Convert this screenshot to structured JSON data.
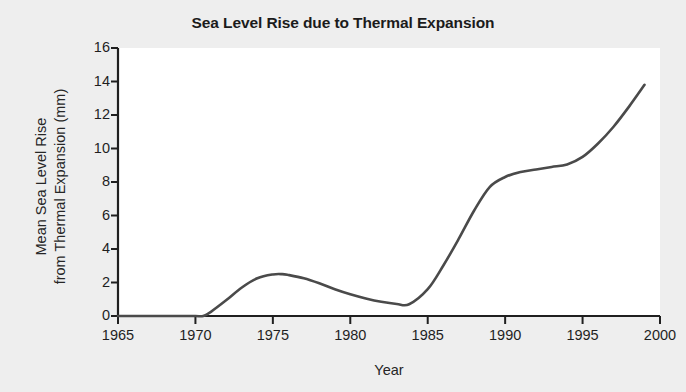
{
  "chart_data": {
    "type": "line",
    "title": "Sea Level Rise due to Thermal Expansion",
    "xlabel": "Year",
    "ylabel": "Mean Sea Level Rise\nfrom Thermal Expansion (mm)",
    "ylabel_line1": "Mean Sea Level Rise",
    "ylabel_line2": "from Thermal Expansion (mm)",
    "xlim": [
      1965,
      2000
    ],
    "ylim": [
      0,
      16
    ],
    "xticks": [
      1965,
      1970,
      1975,
      1980,
      1985,
      1990,
      1995,
      2000
    ],
    "xtick_labels": [
      "1965",
      "1970",
      "1975",
      "1980",
      "1985",
      "1990",
      "1995",
      "2000"
    ],
    "yticks": [
      0,
      2,
      4,
      6,
      8,
      10,
      12,
      14,
      16
    ],
    "ytick_labels": [
      "0",
      "2",
      "4",
      "6",
      "8",
      "10",
      "12",
      "14",
      "16"
    ],
    "grid": false,
    "legend": null,
    "line_color": "#4a4a4a",
    "line_width": 2.6,
    "plot_background": "#ffffff",
    "figure_background": "#eeeeee",
    "axis_color": "#1f1f1f",
    "series": [
      {
        "name": "Mean sea level rise from thermal expansion",
        "x": [
          1965,
          1966,
          1967,
          1968,
          1969,
          1970,
          1970.5,
          1971,
          1972,
          1973,
          1974,
          1975,
          1975.6,
          1976,
          1977,
          1978,
          1979,
          1980,
          1981,
          1982,
          1983,
          1983.8,
          1985,
          1986,
          1987,
          1988,
          1989,
          1990,
          1991,
          1992,
          1993,
          1994,
          1995,
          1996,
          1997,
          1998,
          1999
        ],
        "y": [
          0,
          0,
          0,
          0,
          0,
          0,
          0,
          0.25,
          0.95,
          1.7,
          2.25,
          2.48,
          2.5,
          2.45,
          2.25,
          1.95,
          1.6,
          1.3,
          1.05,
          0.85,
          0.72,
          0.7,
          1.6,
          3.0,
          4.6,
          6.3,
          7.7,
          8.3,
          8.6,
          8.75,
          8.9,
          9.05,
          9.5,
          10.3,
          11.3,
          12.5,
          13.8
        ]
      }
    ],
    "annotations": {
      "peak": {
        "x": 1975.6,
        "y": 2.5
      },
      "trough": {
        "x": 1983.8,
        "y": 0.7
      },
      "plateau": {
        "x_range": [
          1990,
          1994
        ],
        "y": 8.8
      },
      "end": {
        "x": 1999,
        "y": 13.8
      },
      "rise_start": {
        "x": 1970.5,
        "y": 0
      }
    }
  }
}
